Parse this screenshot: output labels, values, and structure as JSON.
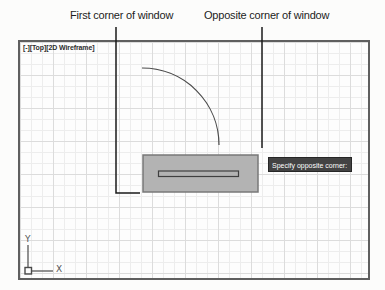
{
  "annotations": {
    "first_corner_label": "First corner of window",
    "opposite_corner_label": "Opposite corner of window"
  },
  "viewport": {
    "controls_label": "[-][Top][2D Wireframe]"
  },
  "tooltip": {
    "text": "Specify opposite corner:"
  },
  "ucs": {
    "x_label": "X",
    "y_label": "Y"
  },
  "colors": {
    "selection_fill": "#b3b3b3",
    "selection_border": "#787878",
    "tooltip_bg": "#434343",
    "tooltip_text": "#ffffff",
    "line_dark": "#1a1a1a",
    "geometry_stroke": "#4a4a4a",
    "grid_minor": "#ededed",
    "grid_major": "#dcdcdc"
  }
}
